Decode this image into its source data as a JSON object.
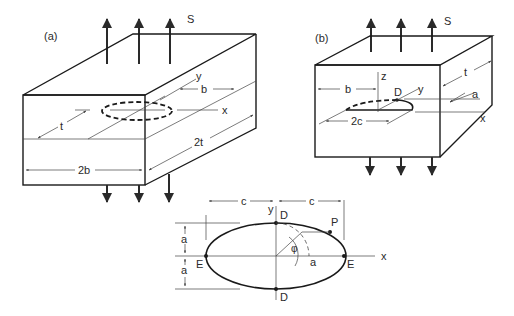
{
  "figure": {
    "panel_a": {
      "label": "(a)",
      "load_label": "S",
      "dims": {
        "y_axis": "y",
        "x_axis": "x",
        "half_width": "b",
        "thickness": "t",
        "full_thickness": "2t",
        "full_width": "2b"
      },
      "description": "Plate of width 2b and thickness 2t with embedded elliptical crack under remote tension S"
    },
    "panel_b": {
      "label": "(b)",
      "load_label": "S",
      "dims": {
        "z_axis": "z",
        "y_axis": "y",
        "x_axis": "x",
        "point": "D",
        "distance_from_edge": "b",
        "crack_depth": "a",
        "crack_length": "2c",
        "thickness": "t"
      },
      "description": "Plate of thickness t with semi-elliptical surface crack under remote tension S"
    },
    "ellipse_detail": {
      "y_axis": "y",
      "x_axis": "x",
      "semi_major_left": "c",
      "semi_major_right": "c",
      "semi_minor_top": "a",
      "semi_minor_bottom": "a",
      "point_top": "D",
      "point_bottom": "D",
      "point_left": "E",
      "point_right": "E",
      "point_on_front": "P",
      "angle": "φ",
      "radius": "a"
    }
  }
}
